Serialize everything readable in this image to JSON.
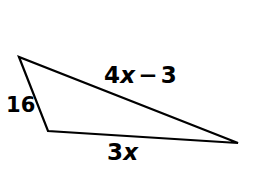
{
  "figure": {
    "kind": "triangle-diagram",
    "background_color": "#ffffff",
    "stroke_color": "#000000",
    "text_color": "#000000",
    "stroke_width": 2,
    "width": 257,
    "height": 170
  },
  "vertices": {
    "apex": {
      "name": "top-left-vertex",
      "x": 19,
      "y": 57
    },
    "lower_left": {
      "name": "bottom-left-vertex",
      "x": 48,
      "y": 131
    },
    "right": {
      "name": "right-vertex",
      "x": 238,
      "y": 143
    }
  },
  "sides": [
    {
      "id": "left-side",
      "from": "apex",
      "to": "lower_left",
      "label": "16",
      "label_parts": [
        {
          "text": "16",
          "style": "upright"
        }
      ]
    },
    {
      "id": "top-side",
      "from": "apex",
      "to": "right",
      "label": "4x − 3",
      "label_parts": [
        {
          "text": "4",
          "style": "upright"
        },
        {
          "text": "x",
          "style": "italic"
        },
        {
          "text": "−",
          "style": "operator"
        },
        {
          "text": "3",
          "style": "upright"
        }
      ]
    },
    {
      "id": "bottom-side",
      "from": "lower_left",
      "to": "right",
      "label": "3x",
      "label_parts": [
        {
          "text": "3",
          "style": "upright"
        },
        {
          "text": "x",
          "style": "italic"
        }
      ]
    }
  ],
  "labels": {
    "left_side": "16",
    "top_side_coefficient": "4",
    "top_side_variable": "x",
    "top_side_operator": "−",
    "top_side_constant": "3",
    "bottom_side_coefficient": "3",
    "bottom_side_variable": "x"
  }
}
